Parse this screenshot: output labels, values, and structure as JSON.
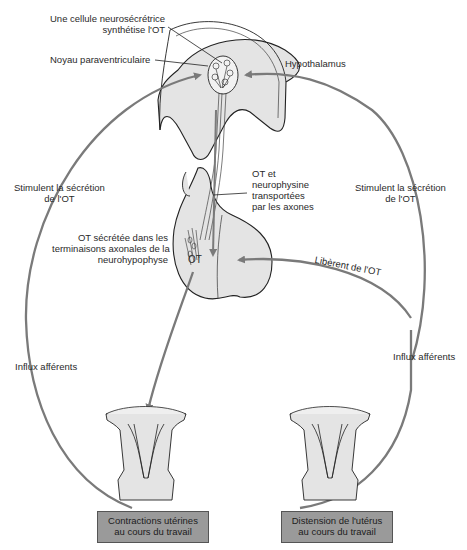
{
  "figure": {
    "labels": {
      "neurosecretory_cell_line1": "Une cellule neurosécrétrice",
      "neurosecretory_cell_line2": "synthétise l'OT",
      "paraventricular_nucleus": "Noyau paraventriculaire",
      "hypothalamus": "Hypothalamus",
      "stimulate_left_line1": "Stimulent la sécrétion",
      "stimulate_left_line2": "de l'OT",
      "stimulate_right_line1": "Stimulent la sécrétion",
      "stimulate_right_line2": "de l'OT",
      "transport_line1": "OT et",
      "transport_line2": "neurophysine",
      "transport_line3": "transportées",
      "transport_line4": "par les axones",
      "secreted_line1": "OT sécrétée dans les",
      "secreted_line2": "terminaisons axonales de la",
      "secreted_line3": "neurohypophyse",
      "ot_marker": "OT",
      "release": "Libèrent de l'OT",
      "afferent_left": "Influx afférents",
      "afferent_right": "Influx afférents"
    },
    "boxes": {
      "contractions_line1": "Contractions utérines",
      "contractions_line2": "au cours du travail",
      "distension_line1": "Distension de l'utérus",
      "distension_line2": "au cours du travail"
    },
    "colors": {
      "tissue_fill": "#e4e4e4",
      "arrow": "#7a7a7a",
      "outline": "#222222",
      "box_fill": "#9a9a9a"
    }
  }
}
